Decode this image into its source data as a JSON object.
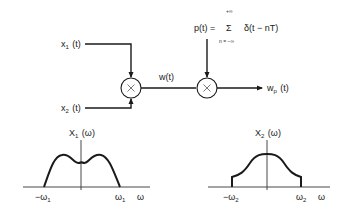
{
  "diagram": {
    "type": "block-diagram-with-spectra",
    "inputs": [
      {
        "id": "x1",
        "label_base": "x",
        "label_sub": "1",
        "label_arg": " (t)"
      },
      {
        "id": "x2",
        "label_base": "x",
        "label_sub": "2",
        "label_arg": " (t)"
      }
    ],
    "multiplier_symbol": "×",
    "intermediate": {
      "label": "w(t)"
    },
    "impulse_train": {
      "lhs": "p(t) =",
      "sum_symbol": "Σ",
      "upper_limit": "+∞",
      "lower_limit": "n = −∞",
      "term": "δ(t − nT)"
    },
    "output": {
      "label_base": "w",
      "label_sub": "p",
      "label_arg": " (t)"
    },
    "spectra": [
      {
        "title_base": "X",
        "title_sub": "1",
        "title_arg": " (ω)",
        "left_tick": "−ω",
        "left_tick_sub": "1",
        "right_tick": "ω",
        "right_tick_sub": "1",
        "axis_label": "ω",
        "shape": "double-hump band-limited"
      },
      {
        "title_base": "X",
        "title_sub": "2",
        "title_arg": " (ω)",
        "left_tick": "−ω",
        "left_tick_sub": "2",
        "right_tick": "ω",
        "right_tick_sub": "2",
        "axis_label": "ω",
        "shape": "single-peak with step edges"
      }
    ]
  },
  "colors": {
    "ink": "#1a1a1a",
    "background": "#ffffff"
  }
}
